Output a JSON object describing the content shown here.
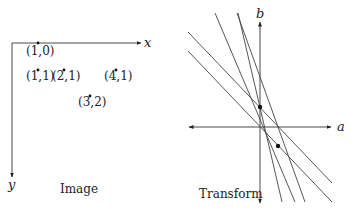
{
  "image_panel": {
    "caption": "Image",
    "x_axis_label": "x",
    "y_axis_label": "y",
    "points": [
      {
        "label": "(1,0)",
        "x": 1,
        "y": 0
      },
      {
        "label": "(1,1)",
        "x": 1,
        "y": 1
      },
      {
        "label": "(2,1)",
        "x": 2,
        "y": 1
      },
      {
        "label": "(4,1)",
        "x": 4,
        "y": 1
      },
      {
        "label": "(3,2)",
        "x": 3,
        "y": 2
      }
    ]
  },
  "transform_panel": {
    "caption": "Transform",
    "a_axis_label": "a",
    "b_axis_label": "b",
    "line_count": 5,
    "intersection_dot_count": 2
  },
  "colors": {
    "ink": "#222222",
    "line": "#444444",
    "background": "#ffffff"
  }
}
